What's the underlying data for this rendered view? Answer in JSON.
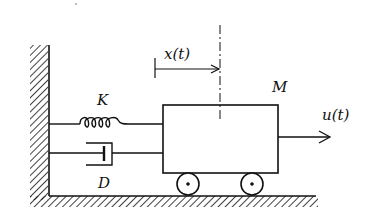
{
  "diagram": {
    "type": "mass-spring-damper system",
    "labels": {
      "displacement": "x(t)",
      "mass": "M",
      "spring": "K",
      "damper": "D",
      "force": "u(t)"
    },
    "colors": {
      "stroke": "#111111",
      "background": "#ffffff"
    }
  }
}
